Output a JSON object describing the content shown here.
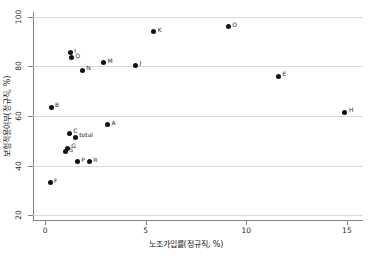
{
  "chart_data": {
    "type": "scatter",
    "title": "",
    "xlabel": "노조가입률(정규직, %)",
    "ylabel": "보험적용여부(정규직, %)",
    "xlim": [
      -0.6,
      15.8
    ],
    "ylim": [
      18,
      102
    ],
    "xticks": [
      0,
      5,
      10,
      15
    ],
    "xtick_labels": [
      "0",
      "5",
      "10",
      "15"
    ],
    "yticks": [
      20,
      40,
      60,
      80,
      100
    ],
    "ytick_labels": [
      "20",
      "40",
      "60",
      "80",
      "100"
    ],
    "grid": "horizontal",
    "legend": "none",
    "points": [
      {
        "label": "B",
        "x": 0.3,
        "y": 63.5
      },
      {
        "label": "F",
        "x": 0.25,
        "y": 33.0
      },
      {
        "label": "S",
        "x": 1.0,
        "y": 45.5
      },
      {
        "label": "G",
        "x": 1.1,
        "y": 47.0
      },
      {
        "label": "C",
        "x": 1.2,
        "y": 53.0
      },
      {
        "label": "I",
        "x": 1.25,
        "y": 85.5
      },
      {
        "label": "Q",
        "x": 1.3,
        "y": 83.5
      },
      {
        "label": "total",
        "x": 1.5,
        "y": 51.5
      },
      {
        "label": "P",
        "x": 1.6,
        "y": 41.5
      },
      {
        "label": "N",
        "x": 1.85,
        "y": 78.5
      },
      {
        "label": "R",
        "x": 2.2,
        "y": 41.5
      },
      {
        "label": "M",
        "x": 2.9,
        "y": 81.5
      },
      {
        "label": "A",
        "x": 3.1,
        "y": 56.5
      },
      {
        "label": "J",
        "x": 4.5,
        "y": 80.5
      },
      {
        "label": "K",
        "x": 5.4,
        "y": 94.0
      },
      {
        "label": "O",
        "x": 9.1,
        "y": 96.0
      },
      {
        "label": "E",
        "x": 11.6,
        "y": 76.0
      },
      {
        "label": "H",
        "x": 14.9,
        "y": 61.5
      }
    ]
  }
}
